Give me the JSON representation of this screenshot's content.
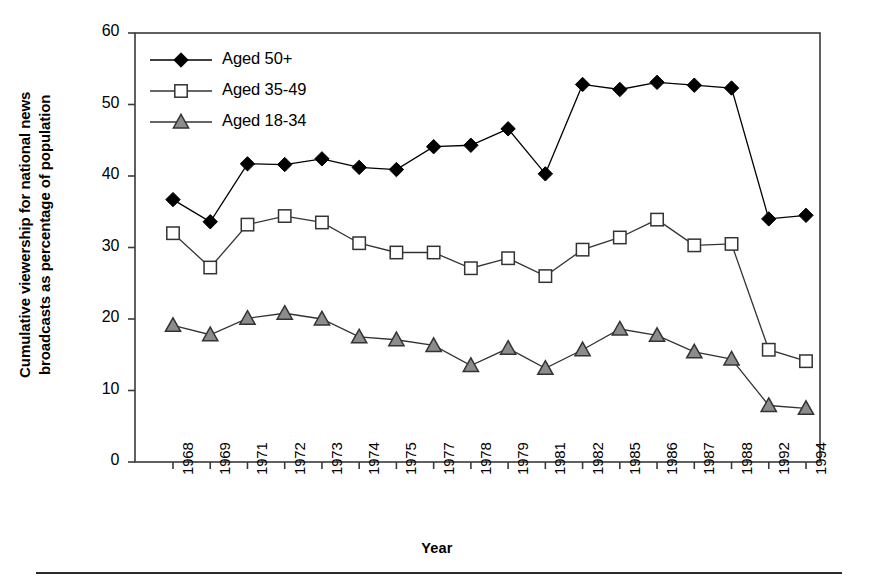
{
  "chart_data": {
    "type": "line",
    "title": "",
    "xlabel": "Year",
    "ylabel_line1": "Cumulative viewership for national news",
    "ylabel_line2": "broadcasts as percentage of population",
    "categories": [
      "1968",
      "1969",
      "1971",
      "1972",
      "1973",
      "1974",
      "1975",
      "1977",
      "1978",
      "1979",
      "1981",
      "1982",
      "1985",
      "1986",
      "1987",
      "1988",
      "1992",
      "1994"
    ],
    "ylim": [
      0,
      60
    ],
    "yticks": [
      0,
      10,
      20,
      30,
      40,
      50,
      60
    ],
    "grid": false,
    "legend_position": "top-left inside plot",
    "series": [
      {
        "name": "Aged 50+",
        "marker": "filled-diamond",
        "color": "#000000",
        "fill": "#000000",
        "values": [
          36.7,
          33.6,
          41.7,
          41.6,
          42.4,
          41.2,
          40.9,
          44.1,
          44.3,
          46.6,
          40.3,
          52.8,
          52.1,
          53.1,
          52.7,
          52.3,
          34.0,
          34.5
        ]
      },
      {
        "name": "Aged 35-49",
        "marker": "open-square",
        "color": "#333333",
        "fill": "#ffffff",
        "values": [
          32.0,
          27.2,
          33.2,
          34.4,
          33.5,
          30.6,
          29.3,
          29.3,
          27.1,
          28.5,
          26.0,
          29.7,
          31.4,
          33.9,
          30.3,
          30.5,
          15.7,
          14.1
        ]
      },
      {
        "name": "Aged 18-34",
        "marker": "filled-triangle",
        "color": "#333333",
        "fill": "#8c8c8c",
        "values": [
          19.1,
          17.8,
          20.1,
          20.8,
          20.0,
          17.5,
          17.1,
          16.3,
          13.5,
          15.9,
          13.1,
          15.7,
          18.6,
          17.7,
          15.4,
          14.4,
          7.9,
          7.5
        ]
      }
    ]
  },
  "legend": {
    "items": [
      {
        "label": "Aged 50+"
      },
      {
        "label": "Aged 35-49"
      },
      {
        "label": "Aged 18-34"
      }
    ]
  }
}
